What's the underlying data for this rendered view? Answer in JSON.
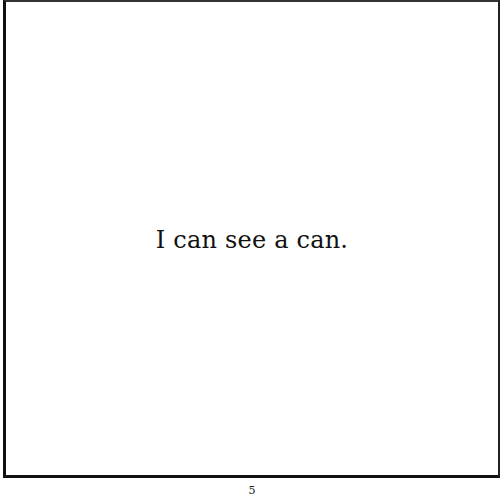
{
  "page": {
    "text": "I can see a can.",
    "page_number": "5"
  },
  "colors": {
    "border": "#111111",
    "text": "#111111",
    "background": "#ffffff"
  }
}
